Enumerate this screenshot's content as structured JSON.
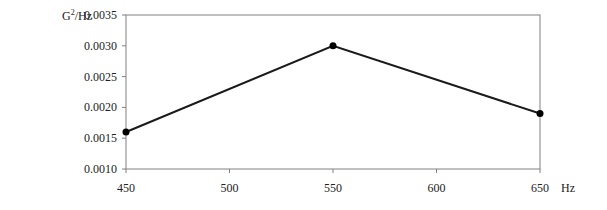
{
  "chart_data": {
    "type": "line",
    "title": "",
    "xlabel": "Hz",
    "ylabel": "G²/Hz",
    "x": [
      450,
      550,
      650
    ],
    "series": [
      {
        "name": "PSD",
        "values": [
          0.0016,
          0.003,
          0.0019
        ]
      }
    ],
    "xlim": [
      450,
      650
    ],
    "ylim": [
      0.001,
      0.0035
    ],
    "x_ticks": [
      "450",
      "500",
      "550",
      "600",
      "650"
    ],
    "y_ticks": [
      "0.0010",
      "0.0015",
      "0.0020",
      "0.0025",
      "0.0030",
      "0.0035"
    ],
    "grid": false,
    "legend": "none",
    "markers": true,
    "colors": {
      "line": "#1a1a1a",
      "frame": "#808080",
      "marker": "#000000"
    }
  },
  "labels": {
    "y_unit_base": "G",
    "y_unit_sup": "2",
    "y_unit_rest": "/Hz",
    "x_unit": "Hz"
  }
}
